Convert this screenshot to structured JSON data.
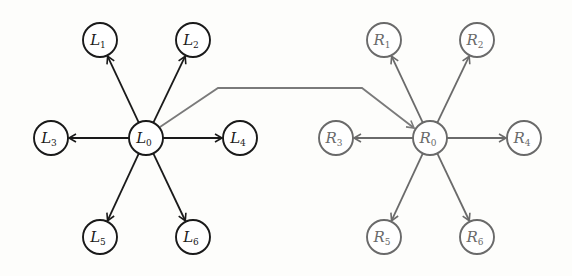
{
  "diagram": {
    "type": "two-star-graphs",
    "node_radius": 17,
    "colors": {
      "left": "#1a1a1a",
      "right": "#6a6a6a",
      "bridge": "#7a7a7a",
      "node_fill": "#ffffff",
      "background": "#fdfdfb"
    },
    "left_graph": {
      "center": {
        "id": "L0",
        "letter": "L",
        "sub": "0",
        "x": 146,
        "y": 138
      },
      "leaves": [
        {
          "id": "L1",
          "letter": "L",
          "sub": "1",
          "x": 100,
          "y": 40
        },
        {
          "id": "L2",
          "letter": "L",
          "sub": "2",
          "x": 193,
          "y": 40
        },
        {
          "id": "L3",
          "letter": "L",
          "sub": "3",
          "x": 51,
          "y": 138
        },
        {
          "id": "L4",
          "letter": "L",
          "sub": "4",
          "x": 240,
          "y": 138
        },
        {
          "id": "L5",
          "letter": "L",
          "sub": "5",
          "x": 100,
          "y": 237
        },
        {
          "id": "L6",
          "letter": "L",
          "sub": "6",
          "x": 193,
          "y": 237
        }
      ]
    },
    "right_graph": {
      "center": {
        "id": "R0",
        "letter": "R",
        "sub": "0",
        "x": 430,
        "y": 138
      },
      "leaves": [
        {
          "id": "R1",
          "letter": "R",
          "sub": "1",
          "x": 384,
          "y": 40
        },
        {
          "id": "R2",
          "letter": "R",
          "sub": "2",
          "x": 477,
          "y": 40
        },
        {
          "id": "R3",
          "letter": "R",
          "sub": "3",
          "x": 336,
          "y": 138
        },
        {
          "id": "R4",
          "letter": "R",
          "sub": "4",
          "x": 524,
          "y": 138
        },
        {
          "id": "R5",
          "letter": "R",
          "sub": "5",
          "x": 384,
          "y": 237
        },
        {
          "id": "R6",
          "letter": "R",
          "sub": "6",
          "x": 477,
          "y": 237
        }
      ]
    },
    "bridge_edge": {
      "from": "L0",
      "to": "R0",
      "points": [
        [
          160,
          127
        ],
        [
          218,
          88
        ],
        [
          362,
          88
        ],
        [
          414,
          128
        ]
      ]
    }
  }
}
